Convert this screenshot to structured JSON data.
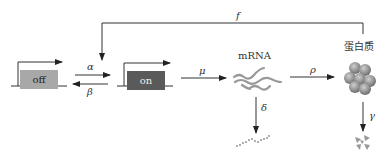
{
  "diagram": {
    "states": {
      "off": {
        "label": "off",
        "color": "#a8a8a8"
      },
      "on": {
        "label": "on",
        "color": "#5a5a5a"
      }
    },
    "nodes": {
      "mrna": {
        "label": "mRNA"
      },
      "protein": {
        "label": "蛋白质"
      }
    },
    "rates": {
      "alpha": "α",
      "beta": "β",
      "mu": "μ",
      "rho": "ρ",
      "delta": "δ",
      "gamma": "γ",
      "feedback": "f"
    }
  }
}
